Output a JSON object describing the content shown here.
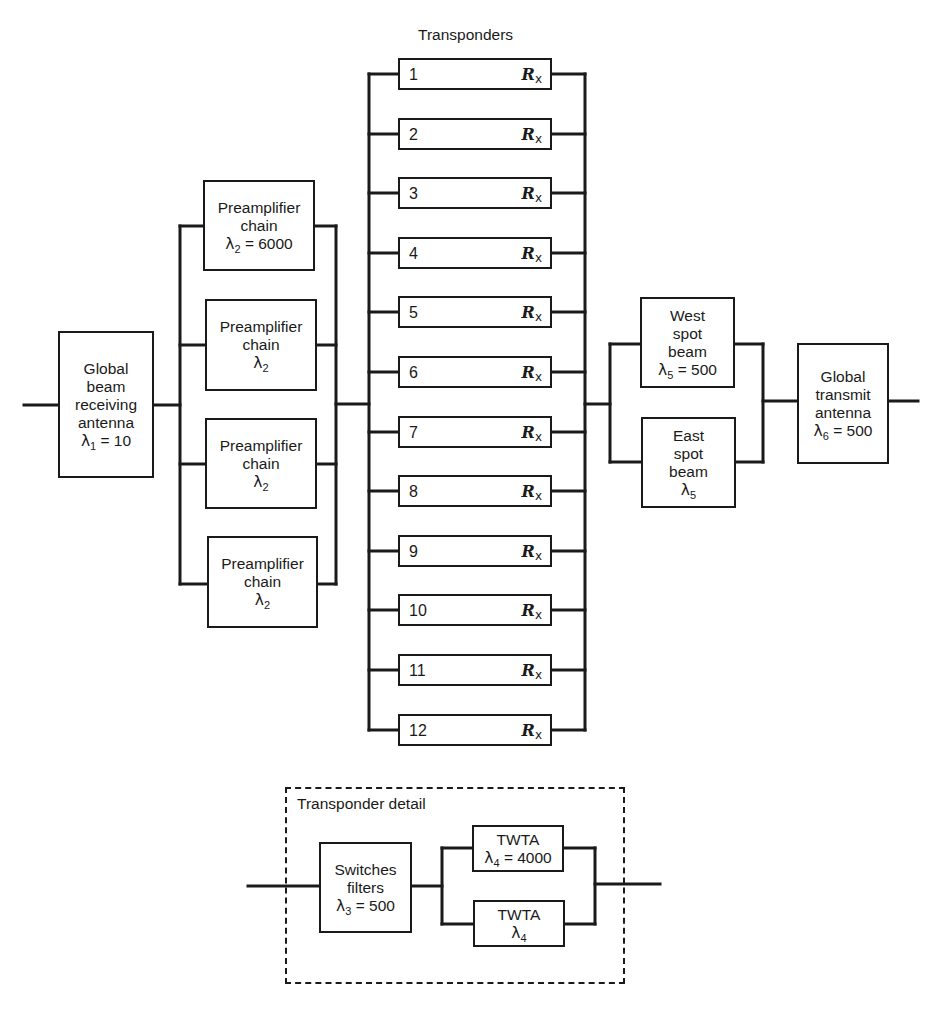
{
  "diagram": {
    "type": "reliability-block-diagram",
    "title": "Transponders",
    "colors": {
      "line": "#1a1a1a",
      "background": "#ffffff"
    },
    "receive_antenna": {
      "lines": [
        "Global",
        "beam",
        "receiving",
        "antenna"
      ],
      "lambda_symbol": "λ",
      "lambda_sub": "1",
      "lambda_value": " = 10"
    },
    "preamplifiers": [
      {
        "lines": [
          "Preamplifier",
          "chain"
        ],
        "lambda_symbol": "λ",
        "lambda_sub": "2",
        "lambda_value": " = 6000"
      },
      {
        "lines": [
          "Preamplifier",
          "chain"
        ],
        "lambda_symbol": "λ",
        "lambda_sub": "2",
        "lambda_value": ""
      },
      {
        "lines": [
          "Preamplifier",
          "chain"
        ],
        "lambda_symbol": "λ",
        "lambda_sub": "2",
        "lambda_value": ""
      },
      {
        "lines": [
          "Preamplifier",
          "chain"
        ],
        "lambda_symbol": "λ",
        "lambda_sub": "2",
        "lambda_value": ""
      }
    ],
    "transponders": {
      "header": "Transponders",
      "reliability_symbol": "R",
      "reliability_sub": "x",
      "items": [
        "1",
        "2",
        "3",
        "4",
        "5",
        "6",
        "7",
        "8",
        "9",
        "10",
        "11",
        "12"
      ]
    },
    "spot_beams": [
      {
        "lines": [
          "West",
          "spot",
          "beam"
        ],
        "lambda_symbol": "λ",
        "lambda_sub": "5",
        "lambda_value": " = 500"
      },
      {
        "lines": [
          "East",
          "spot",
          "beam"
        ],
        "lambda_symbol": "λ",
        "lambda_sub": "5",
        "lambda_value": ""
      }
    ],
    "transmit_antenna": {
      "lines": [
        "Global",
        "transmit",
        "antenna"
      ],
      "lambda_symbol": "λ",
      "lambda_sub": "6",
      "lambda_value": " = 500"
    },
    "transponder_detail": {
      "label": "Transponder detail",
      "switches": {
        "lines": [
          "Switches",
          "filters"
        ],
        "lambda_symbol": "λ",
        "lambda_sub": "3",
        "lambda_value": " = 500"
      },
      "twtas": [
        {
          "lines": [
            "TWTA"
          ],
          "lambda_symbol": "λ",
          "lambda_sub": "4",
          "lambda_value": " = 4000"
        },
        {
          "lines": [
            "TWTA"
          ],
          "lambda_symbol": "λ",
          "lambda_sub": "4",
          "lambda_value": ""
        }
      ]
    }
  }
}
